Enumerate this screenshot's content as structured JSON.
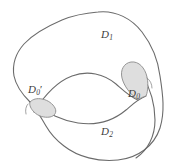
{
  "figure": {
    "type": "venn-like-domain-diagram",
    "width": 176,
    "height": 167,
    "background_color": "#ffffff",
    "stroke_color": "#6b6b6b",
    "shaded_fill_color": "#dedede",
    "label_color": "#3c3c3c",
    "labels": {
      "d1": {
        "base": "D",
        "sub": "1",
        "prime": "",
        "full": "D1"
      },
      "d2": {
        "base": "D",
        "sub": "2",
        "prime": "",
        "full": "D2"
      },
      "d0": {
        "base": "D",
        "sub": "0",
        "prime": "",
        "full": "D0"
      },
      "d0prime": {
        "base": "D",
        "sub": "0",
        "prime": "′",
        "full": "D0'"
      }
    },
    "regions": [
      {
        "name": "D1",
        "description": "upper domain",
        "shaded": false
      },
      {
        "name": "D2",
        "description": "lower domain",
        "shaded": false
      },
      {
        "name": "D0",
        "description": "right lens-shaped overlap region",
        "shaded": true
      },
      {
        "name": "D0'",
        "description": "left lens-shaped overlap region",
        "shaded": true
      }
    ]
  }
}
